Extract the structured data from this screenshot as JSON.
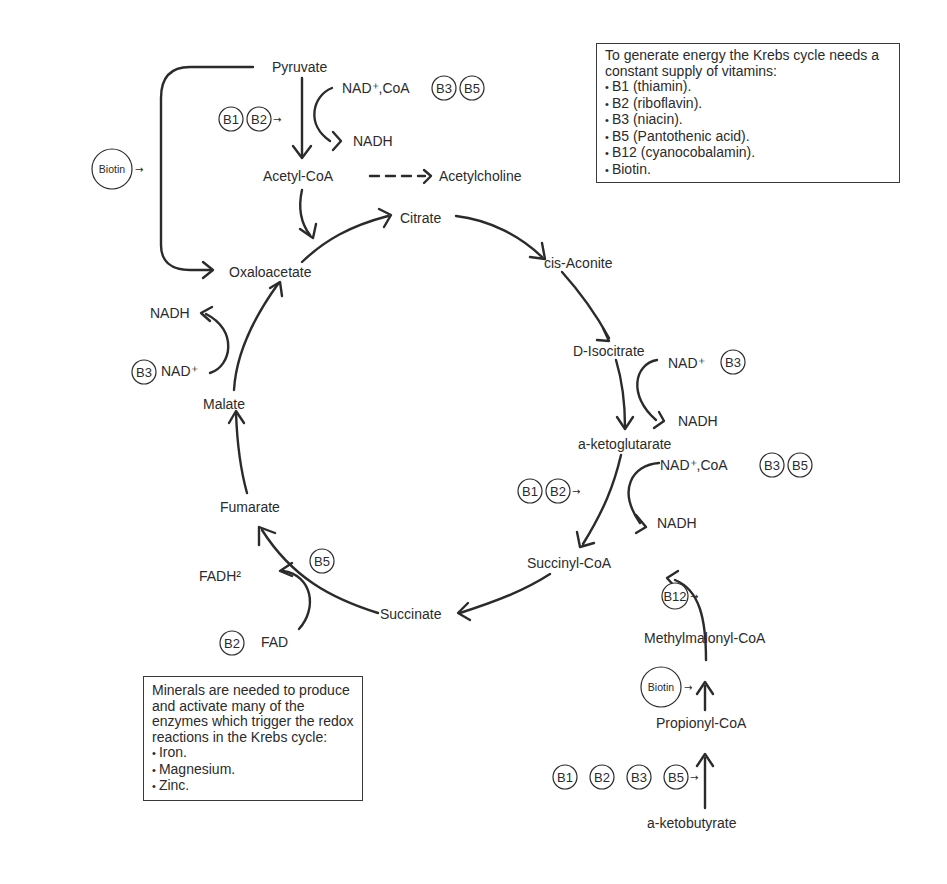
{
  "metabolites": {
    "pyruvate": "Pyruvate",
    "acetyl_coa": "Acetyl-CoA",
    "acetylcholine": "Acetylcholine",
    "citrate": "Citrate",
    "cis_aconite": "cis-Aconite",
    "d_isocitrate": "D-Isocitrate",
    "a_ketoglutarate": "a-ketoglutarate",
    "succinyl_coa": "Succinyl-CoA",
    "succinate": "Succinate",
    "fumarate": "Fumarate",
    "malate": "Malate",
    "oxaloacetate": "Oxaloacetate",
    "methylmalonyl_coa": "Methylmalonyl-CoA",
    "propionyl_coa": "Propionyl-CoA",
    "a_ketobutyrate": "a-ketobutyrate"
  },
  "cofactors": {
    "pyruvate_in": "NAD⁺,CoA",
    "pyruvate_out": "NADH",
    "isocitrate_in": "NAD⁺",
    "isocitrate_out": "NADH",
    "ketoglutarate_in": "NAD⁺,CoA",
    "ketoglutarate_out": "NADH",
    "malate_in": "NAD⁺",
    "malate_out": "NADH",
    "succinate_in": "FAD",
    "succinate_out": "FADH²"
  },
  "vitamin_badges": {
    "b1": "B1",
    "b2": "B2",
    "b3": "B3",
    "b5": "B5",
    "b12": "B12",
    "biotin": "Biotin"
  },
  "vitamin_box": {
    "intro": "To generate energy the Krebs cycle needs a constant supply of vitamins:",
    "items": [
      "B1 (thiamin).",
      "B2 (riboflavin).",
      "B3 (niacin).",
      "B5 (Pantothenic acid).",
      "B12 (cyanocobalamin).",
      "Biotin."
    ]
  },
  "mineral_box": {
    "intro": "Minerals are needed to produce and activate many of the enzymes which trigger the redox reactions in the Krebs cycle:",
    "items": [
      "Iron.",
      "Magnesium.",
      "Zinc."
    ]
  },
  "colors": {
    "ink": "#2b2b2b",
    "background": "#ffffff"
  }
}
